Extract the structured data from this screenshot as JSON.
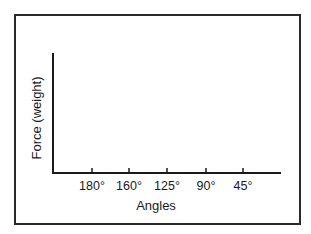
{
  "chart_data": {
    "type": "line",
    "title": "",
    "xlabel": "Angles",
    "ylabel": "Force (weight)",
    "categories": [
      "180°",
      "160°",
      "125°",
      "90°",
      "45°"
    ],
    "series": [],
    "grid": false,
    "legend": null,
    "note": "Blank axes template; no data plotted"
  },
  "ticks": [
    {
      "label": "180°",
      "x": 92
    },
    {
      "label": "160°",
      "x": 129
    },
    {
      "label": "125°",
      "x": 167
    },
    {
      "label": "90°",
      "x": 206
    },
    {
      "label": "45°",
      "x": 243
    }
  ],
  "colors": {
    "axis": "#1a1a1a",
    "frame": "#2a2a2a",
    "background": "#ffffff"
  }
}
